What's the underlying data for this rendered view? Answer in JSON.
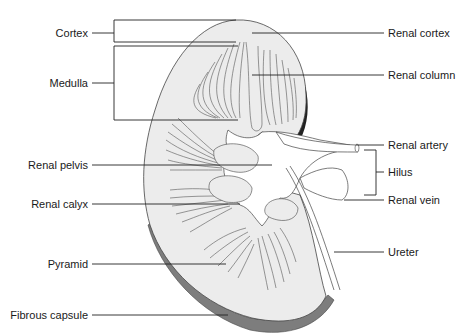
{
  "diagram": {
    "colors": {
      "kidney_fill": "#ededed",
      "capsule_fill": "#7a7a7a",
      "line": "#333333",
      "background": "#ffffff"
    },
    "labels_left": [
      {
        "id": "cortex",
        "text": "Cortex"
      },
      {
        "id": "medulla",
        "text": "Medulla"
      },
      {
        "id": "renal-pelvis",
        "text": "Renal pelvis"
      },
      {
        "id": "renal-calyx",
        "text": "Renal calyx"
      },
      {
        "id": "pyramid",
        "text": "Pyramid"
      },
      {
        "id": "fibrous-capsule",
        "text": "Fibrous capsule"
      }
    ],
    "labels_right": [
      {
        "id": "renal-cortex",
        "text": "Renal cortex"
      },
      {
        "id": "renal-column",
        "text": "Renal column"
      },
      {
        "id": "renal-artery",
        "text": "Renal artery"
      },
      {
        "id": "hilus",
        "text": "Hilus"
      },
      {
        "id": "renal-vein",
        "text": "Renal vein"
      },
      {
        "id": "ureter",
        "text": "Ureter"
      }
    ]
  }
}
